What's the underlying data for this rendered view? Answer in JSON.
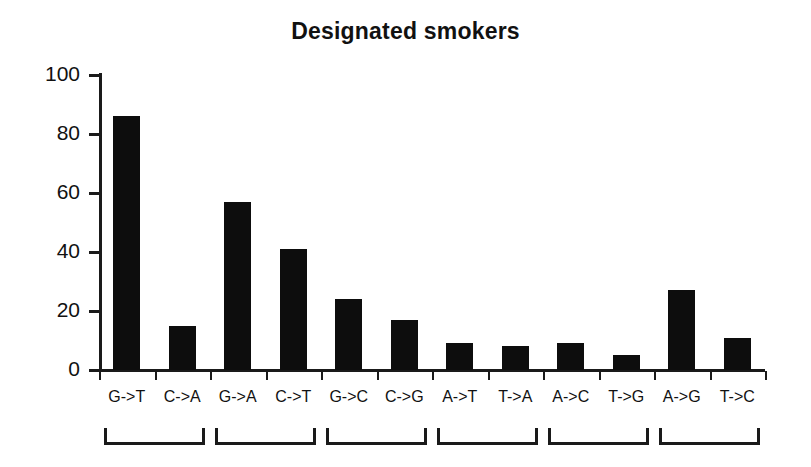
{
  "chart_data": {
    "type": "bar",
    "title": "Designated smokers",
    "xlabel": "",
    "ylabel": "",
    "ylim": [
      0,
      100
    ],
    "yticks": [
      0,
      20,
      40,
      60,
      80,
      100
    ],
    "ytick_labels": [
      "0",
      "20",
      "40",
      "60",
      "80",
      "100"
    ],
    "grid": false,
    "legend": "none",
    "bar_color": "#0d0d0d",
    "categories": [
      "G->T",
      "C->A",
      "G->A",
      "C->T",
      "G->C",
      "C->G",
      "A->T",
      "T->A",
      "A->C",
      "T->G",
      "A->G",
      "T->C"
    ],
    "values": [
      86,
      15,
      57,
      41,
      24,
      17,
      9,
      8,
      9,
      5,
      27,
      11
    ],
    "annotations": {
      "group_brackets": [
        {
          "label": "",
          "categories": [
            "G->T",
            "C->A"
          ]
        },
        {
          "label": "",
          "categories": [
            "G->A",
            "C->T"
          ]
        },
        {
          "label": "",
          "categories": [
            "G->C",
            "C->G"
          ]
        },
        {
          "label": "",
          "categories": [
            "A->T",
            "T->A"
          ]
        },
        {
          "label": "",
          "categories": [
            "A->C",
            "T->G"
          ]
        },
        {
          "label": "",
          "categories": [
            "A->G",
            "T->C"
          ]
        }
      ]
    }
  }
}
